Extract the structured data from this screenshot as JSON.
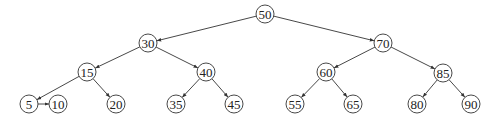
{
  "diagram": {
    "type": "binary-search-tree",
    "node_radius": 9,
    "colors": {
      "stroke": "#333333",
      "fill": "#ffffff",
      "text": "#222222",
      "background": "#ffffff"
    },
    "nodes": [
      {
        "id": "n50",
        "label": "50",
        "x": 265,
        "y": 14
      },
      {
        "id": "n30",
        "label": "30",
        "x": 148,
        "y": 43
      },
      {
        "id": "n70",
        "label": "70",
        "x": 383,
        "y": 43
      },
      {
        "id": "n15",
        "label": "15",
        "x": 87,
        "y": 72
      },
      {
        "id": "n40",
        "label": "40",
        "x": 206,
        "y": 72
      },
      {
        "id": "n60",
        "label": "60",
        "x": 326,
        "y": 72
      },
      {
        "id": "n85",
        "label": "85",
        "x": 443,
        "y": 73
      },
      {
        "id": "n5",
        "label": "5",
        "x": 29,
        "y": 104
      },
      {
        "id": "n10",
        "label": "10",
        "x": 58,
        "y": 104
      },
      {
        "id": "n20",
        "label": "20",
        "x": 116,
        "y": 104
      },
      {
        "id": "n35",
        "label": "35",
        "x": 176,
        "y": 104
      },
      {
        "id": "n45",
        "label": "45",
        "x": 234,
        "y": 104
      },
      {
        "id": "n55",
        "label": "55",
        "x": 295,
        "y": 104
      },
      {
        "id": "n65",
        "label": "65",
        "x": 353,
        "y": 104
      },
      {
        "id": "n80",
        "label": "80",
        "x": 417,
        "y": 104
      },
      {
        "id": "n90",
        "label": "90",
        "x": 471,
        "y": 104
      }
    ],
    "edges": [
      {
        "from": "n50",
        "to": "n30"
      },
      {
        "from": "n50",
        "to": "n70"
      },
      {
        "from": "n30",
        "to": "n15"
      },
      {
        "from": "n30",
        "to": "n40"
      },
      {
        "from": "n70",
        "to": "n60"
      },
      {
        "from": "n70",
        "to": "n85"
      },
      {
        "from": "n15",
        "to": "n5"
      },
      {
        "from": "n15",
        "to": "n20"
      },
      {
        "from": "n5",
        "to": "n10"
      },
      {
        "from": "n40",
        "to": "n35"
      },
      {
        "from": "n40",
        "to": "n45"
      },
      {
        "from": "n60",
        "to": "n55"
      },
      {
        "from": "n60",
        "to": "n65"
      },
      {
        "from": "n85",
        "to": "n80"
      },
      {
        "from": "n85",
        "to": "n90"
      }
    ]
  }
}
